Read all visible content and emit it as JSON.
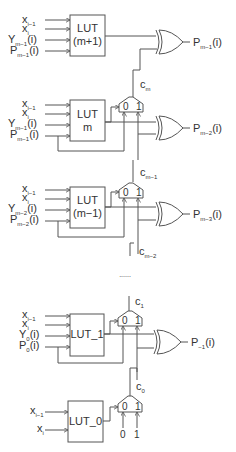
{
  "diagram": {
    "title": "",
    "stages": [
      {
        "lut_label_line1": "LUT",
        "lut_label_line2": "(m+1)",
        "inputs": [
          {
            "base": "x",
            "sub": "i−1",
            "suffix": ""
          },
          {
            "base": "x",
            "sub": "i",
            "suffix": ""
          },
          {
            "base": "Y",
            "sub": "m−1",
            "suffix": "(i)"
          },
          {
            "base": "P",
            "sub": "m−1",
            "suffix": "(i)"
          }
        ],
        "output": {
          "base": "P",
          "sub": "m−1",
          "suffix": "(i)"
        },
        "carry_in": {
          "base": "c",
          "sub": "m"
        },
        "has_mux": false
      },
      {
        "lut_label_line1": "LUT",
        "lut_label_line2": "m",
        "inputs": [
          {
            "base": "x",
            "sub": "i−1",
            "suffix": ""
          },
          {
            "base": "x",
            "sub": "i",
            "suffix": ""
          },
          {
            "base": "Y",
            "sub": "m−1",
            "suffix": "(i)"
          },
          {
            "base": "P",
            "sub": "m−1",
            "suffix": "(i)"
          }
        ],
        "output": {
          "base": "P",
          "sub": "m−2",
          "suffix": "(i)"
        },
        "carry_in": {
          "base": "c",
          "sub": "m−1"
        },
        "mux_inputs": [
          "0",
          "1"
        ],
        "has_mux": true
      },
      {
        "lut_label_line1": "LUT",
        "lut_label_line2": "(m−1)",
        "inputs": [
          {
            "base": "x",
            "sub": "i−1",
            "suffix": ""
          },
          {
            "base": "x",
            "sub": "i",
            "suffix": ""
          },
          {
            "base": "Y",
            "sub": "m−2",
            "suffix": "(i)"
          },
          {
            "base": "P",
            "sub": "m−2",
            "suffix": "(i)"
          }
        ],
        "output": {
          "base": "P",
          "sub": "m−3",
          "suffix": "(i)"
        },
        "carry_in": {
          "base": "c",
          "sub": "m−2"
        },
        "mux_inputs": [
          "0",
          "1"
        ],
        "has_mux": true
      },
      {
        "lut_label_line1": "LUT_1",
        "lut_label_line2": "",
        "inputs": [
          {
            "base": "x",
            "sub": "i−1",
            "suffix": ""
          },
          {
            "base": "x",
            "sub": "i",
            "suffix": ""
          },
          {
            "base": "Y",
            "sub": "0",
            "suffix": "(i)"
          },
          {
            "base": "P",
            "sub": "0",
            "suffix": "(i)"
          }
        ],
        "output": {
          "base": "P",
          "sub": "−1",
          "suffix": "(i)"
        },
        "carry_top": {
          "base": "c",
          "sub": "1"
        },
        "carry_in": {
          "base": "c",
          "sub": "0"
        },
        "mux_inputs": [
          "0",
          "1"
        ],
        "has_mux": true
      },
      {
        "lut_label_line1": "LUT_0",
        "lut_label_line2": "",
        "inputs": [
          {
            "base": "x",
            "sub": "i−1",
            "suffix": ""
          },
          {
            "base": "x",
            "sub": "i",
            "suffix": ""
          }
        ],
        "mux_inputs": [
          "0",
          "1"
        ],
        "mux_constants": [
          "0",
          "1"
        ],
        "has_mux": true
      }
    ],
    "ellipsis": "......"
  },
  "colors": {
    "line": "#555555",
    "text": "#333333",
    "background": "#ffffff"
  }
}
